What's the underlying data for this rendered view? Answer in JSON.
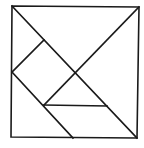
{
  "diagram": {
    "type": "tangram",
    "stroke_color": "#1a1a1a",
    "background": "#ffffff",
    "outer_square": {
      "points": [
        [
          12,
          6
        ],
        [
          139,
          7
        ],
        [
          137,
          138
        ],
        [
          11,
          137
        ]
      ]
    },
    "segments": [
      {
        "name": "main-diagonal",
        "from": [
          12,
          6
        ],
        "to": [
          137,
          138
        ]
      },
      {
        "name": "anti-diagonal-upper",
        "from": [
          139,
          7
        ],
        "to": [
          44,
          105
        ]
      },
      {
        "name": "small-square-top-edge",
        "from": [
          44,
          40
        ],
        "to": [
          12,
          72
        ]
      },
      {
        "name": "left-lower-diagonal",
        "from": [
          12,
          72
        ],
        "to": [
          73,
          138
        ]
      },
      {
        "name": "horizontal-divider",
        "from": [
          44,
          105
        ],
        "to": [
          107,
          106
        ]
      }
    ]
  }
}
